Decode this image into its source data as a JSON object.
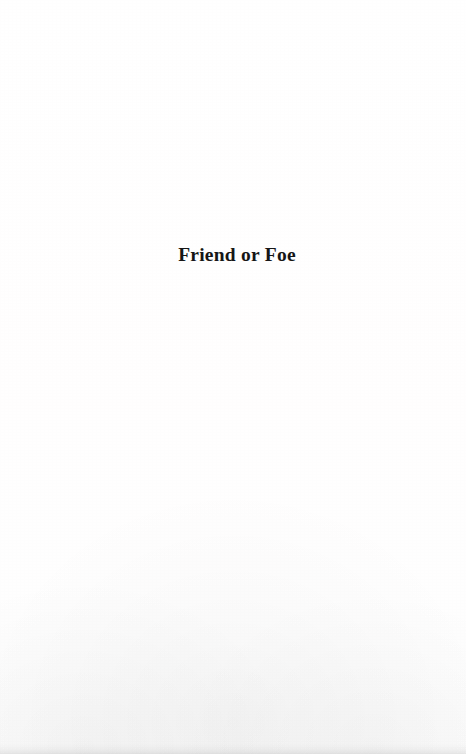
{
  "document": {
    "type": "scanned-book-page",
    "page_kind": "part-title",
    "background_color": "#fffefe",
    "text_color": "#161616"
  },
  "part_title": {
    "heading": "Friend or Foe"
  }
}
